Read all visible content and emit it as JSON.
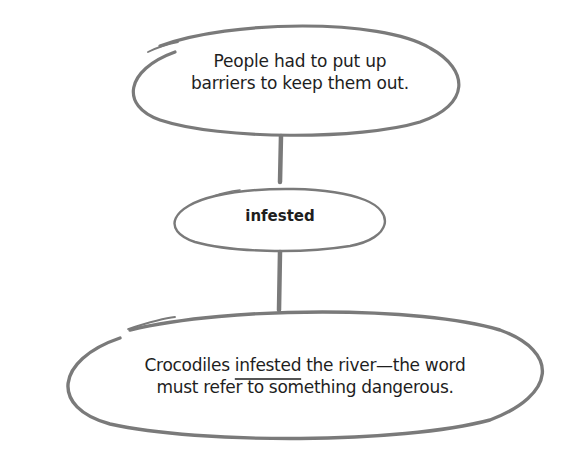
{
  "diagram": {
    "top_node": {
      "lines": [
        "People had to put up",
        "barriers to keep them out."
      ]
    },
    "middle_node": {
      "label": "infested"
    },
    "bottom_node": {
      "line1_before": "Crocodiles ",
      "line1_underlined": "infested",
      "line1_after": " the river—the word",
      "line2": "must refer to something dangerous."
    },
    "colors": {
      "stroke": "#7a7a7a",
      "text": "#1e1e1e",
      "background": "#ffffff"
    }
  }
}
